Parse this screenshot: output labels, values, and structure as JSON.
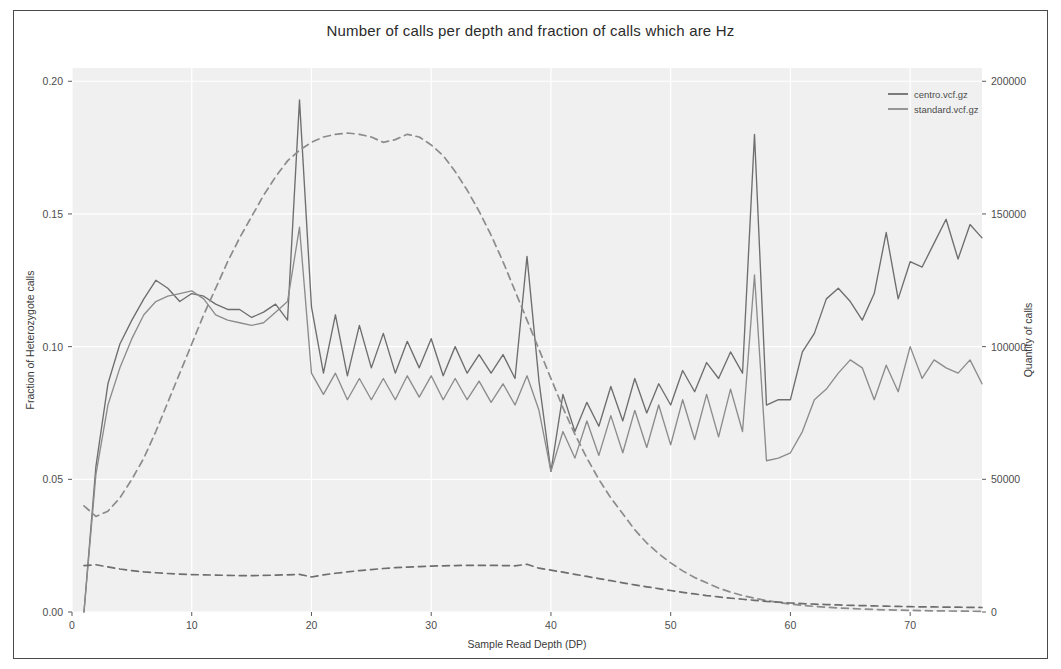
{
  "figure": {
    "title": "Number of calls per depth and fraction of calls which are Hz",
    "background": "#ffffff",
    "panel_background": "#f0f0f0",
    "grid_color": "#ffffff",
    "border_color": "#4a4a4a"
  },
  "legend": {
    "position": "top-right",
    "entries": [
      {
        "label": "centro.vcf.gz",
        "color": "#6e6e6e",
        "style": "solid"
      },
      {
        "label": "standard.vcf.gz",
        "color": "#8c8c8c",
        "style": "solid"
      }
    ]
  },
  "axes": {
    "x": {
      "label": "Sample Read Depth (DP)",
      "ticks": [
        "0",
        "10",
        "20",
        "30",
        "40",
        "50",
        "60",
        "70"
      ],
      "tick_values": [
        0,
        10,
        20,
        30,
        40,
        50,
        60,
        70
      ],
      "range": [
        0,
        76
      ]
    },
    "y_left": {
      "label": "Fraction of Heterozygote calls",
      "ticks": [
        "0.00",
        "0.05",
        "0.10",
        "0.15",
        "0.20"
      ],
      "tick_values": [
        0,
        0.05,
        0.1,
        0.15,
        0.2
      ],
      "range": [
        0,
        0.205
      ]
    },
    "y_right": {
      "label": "Quantity of calls",
      "ticks": [
        "0",
        "50000",
        "100000",
        "150000",
        "200000"
      ],
      "tick_values": [
        0,
        50000,
        100000,
        150000,
        200000
      ],
      "range": [
        0,
        205000
      ]
    }
  },
  "chart_data": {
    "type": "line",
    "title": "Number of calls per depth and fraction of calls which are Hz",
    "xlabel": "Sample Read Depth (DP)",
    "ylabel": "Fraction of Heterozygote calls",
    "ylabel_right": "Quantity of calls",
    "xlim": [
      0,
      76
    ],
    "ylim": [
      0,
      0.205
    ],
    "ylim_right": [
      0,
      205000
    ],
    "grid": true,
    "legend_position": "top right",
    "x": [
      1,
      2,
      3,
      4,
      5,
      6,
      7,
      8,
      9,
      10,
      11,
      12,
      13,
      14,
      15,
      16,
      17,
      18,
      19,
      20,
      21,
      22,
      23,
      24,
      25,
      26,
      27,
      28,
      29,
      30,
      31,
      32,
      33,
      34,
      35,
      36,
      37,
      38,
      39,
      40,
      41,
      42,
      43,
      44,
      45,
      46,
      47,
      48,
      49,
      50,
      51,
      52,
      53,
      54,
      55,
      56,
      57,
      58,
      59,
      60,
      61,
      62,
      63,
      64,
      65,
      66,
      67,
      68,
      69,
      70,
      71,
      72,
      73,
      74,
      75,
      76
    ],
    "series": [
      {
        "name": "centro.vcf.gz fraction",
        "axis": "left",
        "style": "solid",
        "color": "#6e6e6e",
        "values": [
          0.0,
          0.055,
          0.086,
          0.101,
          0.11,
          0.118,
          0.125,
          0.122,
          0.117,
          0.12,
          0.119,
          0.116,
          0.114,
          0.114,
          0.111,
          0.113,
          0.116,
          0.11,
          0.193,
          0.115,
          0.09,
          0.112,
          0.089,
          0.108,
          0.092,
          0.105,
          0.09,
          0.102,
          0.092,
          0.103,
          0.089,
          0.1,
          0.09,
          0.097,
          0.09,
          0.097,
          0.088,
          0.134,
          0.087,
          0.053,
          0.082,
          0.068,
          0.079,
          0.07,
          0.085,
          0.072,
          0.088,
          0.075,
          0.086,
          0.078,
          0.091,
          0.083,
          0.094,
          0.088,
          0.098,
          0.09,
          0.18,
          0.078,
          0.08,
          0.08,
          0.098,
          0.105,
          0.118,
          0.122,
          0.117,
          0.11,
          0.12,
          0.143,
          0.118,
          0.132,
          0.13,
          0.139,
          0.148,
          0.133,
          0.146,
          0.141
        ]
      },
      {
        "name": "standard.vcf.gz fraction",
        "axis": "left",
        "style": "solid",
        "color": "#8c8c8c",
        "values": [
          0.0,
          0.052,
          0.078,
          0.092,
          0.103,
          0.112,
          0.117,
          0.119,
          0.12,
          0.121,
          0.118,
          0.112,
          0.11,
          0.109,
          0.108,
          0.109,
          0.113,
          0.117,
          0.145,
          0.09,
          0.082,
          0.09,
          0.08,
          0.088,
          0.08,
          0.088,
          0.08,
          0.089,
          0.081,
          0.089,
          0.08,
          0.088,
          0.08,
          0.087,
          0.079,
          0.086,
          0.078,
          0.089,
          0.076,
          0.053,
          0.068,
          0.058,
          0.072,
          0.059,
          0.074,
          0.06,
          0.076,
          0.062,
          0.078,
          0.063,
          0.08,
          0.065,
          0.082,
          0.066,
          0.084,
          0.068,
          0.127,
          0.057,
          0.058,
          0.06,
          0.068,
          0.08,
          0.084,
          0.09,
          0.095,
          0.092,
          0.08,
          0.093,
          0.083,
          0.1,
          0.088,
          0.095,
          0.092,
          0.09,
          0.095,
          0.086
        ]
      },
      {
        "name": "standard.vcf.gz quantity",
        "axis": "right",
        "style": "dashed",
        "color": "#8c8c8c",
        "values": [
          40000,
          36000,
          38000,
          43000,
          50000,
          58000,
          68000,
          79000,
          90000,
          101000,
          112000,
          122000,
          132000,
          141000,
          149000,
          157000,
          164000,
          170000,
          174000,
          177000,
          179000,
          180000,
          180500,
          180000,
          179000,
          177000,
          178000,
          180000,
          179000,
          176000,
          172000,
          166000,
          159000,
          151000,
          142000,
          132000,
          121000,
          110000,
          99000,
          88000,
          77000,
          67000,
          58000,
          50000,
          43000,
          37000,
          31000,
          26000,
          22000,
          18500,
          15500,
          13000,
          11000,
          9000,
          7500,
          6200,
          5200,
          4300,
          3600,
          3000,
          2500,
          2100,
          1800,
          1500,
          1300,
          1100,
          950,
          800,
          700,
          600,
          520,
          450,
          400,
          350,
          300,
          260
        ]
      },
      {
        "name": "centro.vcf.gz quantity",
        "axis": "right",
        "style": "dashed",
        "color": "#6e6e6e",
        "values": [
          17500,
          17800,
          17000,
          16200,
          15600,
          15100,
          14800,
          14500,
          14300,
          14100,
          14000,
          13900,
          13800,
          13700,
          13700,
          13800,
          13900,
          14000,
          14200,
          13200,
          14000,
          14600,
          15100,
          15600,
          16000,
          16400,
          16700,
          16900,
          17100,
          17300,
          17400,
          17500,
          17600,
          17600,
          17600,
          17500,
          17400,
          18000,
          16500,
          15800,
          15000,
          14200,
          13400,
          12600,
          11800,
          11000,
          10200,
          9500,
          8800,
          8100,
          7400,
          6800,
          6200,
          5700,
          5200,
          4800,
          4400,
          4000,
          3700,
          3400,
          3150,
          2950,
          2800,
          2650,
          2500,
          2400,
          2300,
          2200,
          2100,
          2000,
          1950,
          1900,
          1850,
          1800,
          1750,
          1700
        ]
      }
    ]
  }
}
